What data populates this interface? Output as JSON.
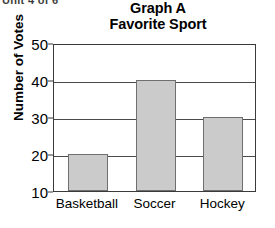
{
  "scan_artifact": "Unit 4 of 6",
  "chart_data": {
    "type": "bar",
    "title": "Graph A",
    "subtitle": "Favorite Sport",
    "categories": [
      "Basketball",
      "Soccer",
      "Hockey"
    ],
    "values": [
      20,
      40,
      30
    ],
    "xlabel": "",
    "ylabel": "Number of Votes",
    "ylim": [
      10,
      50
    ],
    "yticks": [
      10,
      20,
      30,
      40,
      50
    ],
    "ytick_labels": [
      "10",
      "20",
      "30",
      "40",
      "50"
    ],
    "grid": true,
    "legend": false,
    "bar_fill_color": "#cbcbcb",
    "bar_edge_color": "#6f6f6f",
    "axis_color": "#3a3a3a",
    "background_color": "#ffffff"
  }
}
